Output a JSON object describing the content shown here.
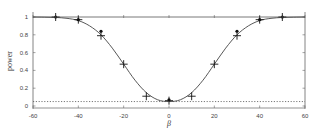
{
  "chart_data": {
    "type": "line",
    "title": "",
    "xlabel": "β",
    "ylabel": "power",
    "xlim": [
      -60,
      60
    ],
    "ylim": [
      0,
      1
    ],
    "xticks": [
      -60,
      -40,
      -20,
      0,
      20,
      40,
      60
    ],
    "xtick_labels": [
      "-60",
      "-40",
      "-20",
      "0",
      "20",
      "40",
      "60"
    ],
    "yticks": [
      0,
      0.2,
      0.4,
      0.6,
      0.8,
      1
    ],
    "ytick_labels": [
      "0",
      "0.2",
      "0.4",
      "0.6",
      "0.8",
      "1"
    ],
    "grid": false,
    "series": [
      {
        "name": "theoretical power curve",
        "style": "solid line",
        "x": [
          -60,
          -55,
          -50,
          -45,
          -40,
          -35,
          -30,
          -25,
          -20,
          -15,
          -10,
          -5,
          0,
          5,
          10,
          15,
          20,
          25,
          30,
          35,
          40,
          45,
          50,
          55,
          60
        ],
        "values": [
          1.0,
          0.998,
          0.995,
          0.985,
          0.96,
          0.9,
          0.8,
          0.65,
          0.47,
          0.29,
          0.15,
          0.07,
          0.05,
          0.07,
          0.15,
          0.29,
          0.47,
          0.65,
          0.8,
          0.9,
          0.96,
          0.985,
          0.995,
          0.998,
          1.0
        ]
      },
      {
        "name": "empirical power (cross markers)",
        "style": "plus markers",
        "x": [
          -50,
          -40,
          -30,
          -20,
          -10,
          0,
          10,
          20,
          30,
          40,
          50
        ],
        "values": [
          1.0,
          0.97,
          0.79,
          0.47,
          0.11,
          0.06,
          0.11,
          0.47,
          0.79,
          0.97,
          1.0
        ]
      },
      {
        "name": "empirical power (dot markers)",
        "style": "dot markers",
        "x": [
          -50,
          -40,
          -30,
          0,
          30,
          40,
          50
        ],
        "values": [
          1.0,
          0.97,
          0.84,
          0.07,
          0.84,
          0.97,
          1.0
        ]
      },
      {
        "name": "nominal level",
        "style": "dotted horizontal line",
        "x": [
          -60,
          60
        ],
        "values": [
          0.05,
          0.05
        ]
      },
      {
        "name": "power = 1 reference",
        "style": "solid horizontal line",
        "x": [
          -60,
          60
        ],
        "values": [
          1.0,
          1.0
        ]
      }
    ]
  }
}
